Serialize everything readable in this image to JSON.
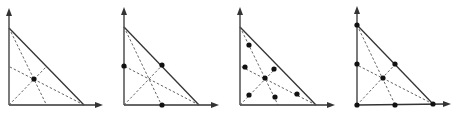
{
  "figure": {
    "colors": {
      "line": "#333333",
      "dash": "#555555",
      "dot": "#111111",
      "background": "#ffffff"
    },
    "panels": [
      {
        "id": "panel-1",
        "origin": [
          9,
          105
        ],
        "top": [
          9,
          28
        ],
        "right": [
          84,
          105
        ],
        "yarrow": [
          9,
          8
        ],
        "xarrow": [
          103,
          105
        ],
        "dots": [
          [
            34,
            79
          ]
        ]
      },
      {
        "id": "panel-2",
        "origin": [
          124,
          105
        ],
        "top": [
          124,
          27
        ],
        "right": [
          199,
          105
        ],
        "yarrow": [
          124,
          7
        ],
        "xarrow": [
          219,
          105
        ],
        "dots": [
          [
            124,
            66
          ],
          [
            162,
            65
          ],
          [
            162,
            105
          ]
        ]
      },
      {
        "id": "panel-3",
        "origin": [
          240,
          105
        ],
        "top": [
          240,
          27
        ],
        "right": [
          316,
          105
        ],
        "yarrow": [
          240,
          7
        ],
        "xarrow": [
          335,
          105
        ],
        "dots": [
          [
            265,
            78
          ],
          [
            249,
            45
          ],
          [
            245,
            67
          ],
          [
            274,
            69
          ],
          [
            249,
            95
          ],
          [
            275,
            97
          ],
          [
            297,
            94
          ]
        ]
      },
      {
        "id": "panel-4",
        "origin": [
          357,
          105
        ],
        "top": [
          357,
          25
        ],
        "right": [
          433,
          104
        ],
        "yarrow": [
          357,
          6
        ],
        "xarrow": [
          451,
          104
        ],
        "dots": [
          [
            357,
            25
          ],
          [
            357,
            64
          ],
          [
            395,
            64
          ],
          [
            383,
            78
          ],
          [
            357,
            105
          ],
          [
            395,
            105
          ],
          [
            433,
            104
          ]
        ]
      }
    ]
  }
}
